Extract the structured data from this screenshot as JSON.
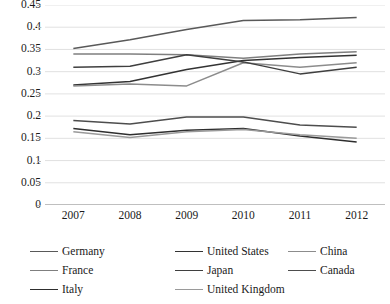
{
  "chart_data": {
    "type": "line",
    "title": "",
    "xlabel": "",
    "ylabel": "",
    "x": [
      "2007",
      "2008",
      "2009",
      "2010",
      "2011",
      "2012"
    ],
    "ylim": [
      0,
      0.45
    ],
    "yticks": [
      "0",
      "0.05",
      "0.1",
      "0.15",
      "0.2",
      "0.25",
      "0.3",
      "0.35",
      "0.4",
      "0.45"
    ],
    "ytick_values": [
      0,
      0.05,
      0.1,
      0.15,
      0.2,
      0.25,
      0.3,
      0.35,
      0.4,
      0.45
    ],
    "grid": "horizontal",
    "legend_position": "bottom",
    "series": [
      {
        "name": "Germany",
        "color": "#595959",
        "values": [
          0.352,
          0.372,
          0.395,
          0.415,
          0.417,
          0.422
        ]
      },
      {
        "name": "United States",
        "color": "#333333",
        "values": [
          0.27,
          0.278,
          0.305,
          0.325,
          0.332,
          0.337
        ]
      },
      {
        "name": "China",
        "color": "#8c8c8c",
        "values": [
          0.268,
          0.272,
          0.268,
          0.32,
          0.31,
          0.32
        ]
      },
      {
        "name": "France",
        "color": "#7f7f7f",
        "values": [
          0.34,
          0.34,
          0.338,
          0.33,
          0.34,
          0.345
        ]
      },
      {
        "name": "Japan",
        "color": "#3f3f3f",
        "values": [
          0.31,
          0.312,
          0.338,
          0.322,
          0.295,
          0.31
        ]
      },
      {
        "name": "Canada",
        "color": "#4d4d4d",
        "values": [
          0.19,
          0.182,
          0.198,
          0.198,
          0.18,
          0.175
        ]
      },
      {
        "name": "Italy",
        "color": "#2e2e2e",
        "values": [
          0.172,
          0.158,
          0.168,
          0.172,
          0.155,
          0.142
        ]
      },
      {
        "name": "United Kingdom",
        "color": "#9a9a9a",
        "values": [
          0.165,
          0.152,
          0.165,
          0.17,
          0.158,
          0.15
        ]
      }
    ]
  }
}
